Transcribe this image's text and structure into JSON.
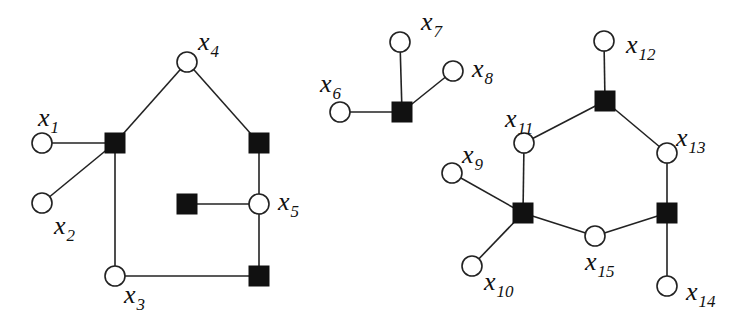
{
  "diagram": {
    "type": "factor-graph",
    "variables": [
      {
        "id": "x1",
        "name": "x",
        "sub": "1",
        "cx": 42,
        "cy": 143,
        "lx": 38,
        "ly": 126
      },
      {
        "id": "x2",
        "name": "x",
        "sub": "2",
        "cx": 42,
        "cy": 203,
        "lx": 54,
        "ly": 234
      },
      {
        "id": "x3",
        "name": "x",
        "sub": "3",
        "cx": 115,
        "cy": 276,
        "lx": 124,
        "ly": 303
      },
      {
        "id": "x4",
        "name": "x",
        "sub": "4",
        "cx": 187,
        "cy": 62,
        "lx": 198,
        "ly": 50
      },
      {
        "id": "x5",
        "name": "x",
        "sub": "5",
        "cx": 259,
        "cy": 204,
        "lx": 278,
        "ly": 210
      },
      {
        "id": "x6",
        "name": "x",
        "sub": "6",
        "cx": 340,
        "cy": 112,
        "lx": 320,
        "ly": 92
      },
      {
        "id": "x7",
        "name": "x",
        "sub": "7",
        "cx": 400,
        "cy": 42,
        "lx": 421,
        "ly": 30
      },
      {
        "id": "x8",
        "name": "x",
        "sub": "8",
        "cx": 453,
        "cy": 71,
        "lx": 472,
        "ly": 77
      },
      {
        "id": "x9",
        "name": "x",
        "sub": "9",
        "cx": 452,
        "cy": 173,
        "lx": 462,
        "ly": 163
      },
      {
        "id": "x10",
        "name": "x",
        "sub": "10",
        "cx": 472,
        "cy": 266,
        "lx": 484,
        "ly": 290
      },
      {
        "id": "x11",
        "name": "x",
        "sub": "11",
        "cx": 524,
        "cy": 143,
        "lx": 505,
        "ly": 127
      },
      {
        "id": "x12",
        "name": "x",
        "sub": "12",
        "cx": 604,
        "cy": 41,
        "lx": 626,
        "ly": 53
      },
      {
        "id": "x13",
        "name": "x",
        "sub": "13",
        "cx": 667,
        "cy": 153,
        "lx": 676,
        "ly": 146
      },
      {
        "id": "x14",
        "name": "x",
        "sub": "14",
        "cx": 667,
        "cy": 286,
        "lx": 686,
        "ly": 300
      },
      {
        "id": "x15",
        "name": "x",
        "sub": "15",
        "cx": 595,
        "cy": 236,
        "lx": 585,
        "ly": 270
      }
    ],
    "factors": [
      {
        "id": "fA",
        "cx": 115,
        "cy": 143
      },
      {
        "id": "fB",
        "cx": 259,
        "cy": 143
      },
      {
        "id": "fC",
        "cx": 187,
        "cy": 204
      },
      {
        "id": "fD",
        "cx": 259,
        "cy": 276
      },
      {
        "id": "fE",
        "cx": 402,
        "cy": 112
      },
      {
        "id": "fF",
        "cx": 605,
        "cy": 101
      },
      {
        "id": "fG",
        "cx": 523,
        "cy": 213
      },
      {
        "id": "fH",
        "cx": 667,
        "cy": 213
      }
    ],
    "edges": [
      [
        "x1",
        "fA"
      ],
      [
        "x2",
        "fA"
      ],
      [
        "x4",
        "fA"
      ],
      [
        "x3",
        "fA"
      ],
      [
        "x4",
        "fB"
      ],
      [
        "fB",
        "x5"
      ],
      [
        "fC",
        "x5"
      ],
      [
        "x5",
        "fD"
      ],
      [
        "x3",
        "fD"
      ],
      [
        "x6",
        "fE"
      ],
      [
        "x7",
        "fE"
      ],
      [
        "x8",
        "fE"
      ],
      [
        "x12",
        "fF"
      ],
      [
        "x11",
        "fF"
      ],
      [
        "x13",
        "fF"
      ],
      [
        "x11",
        "fG"
      ],
      [
        "x9",
        "fG"
      ],
      [
        "x10",
        "fG"
      ],
      [
        "x15",
        "fG"
      ],
      [
        "x13",
        "fH"
      ],
      [
        "x15",
        "fH"
      ],
      [
        "x14",
        "fH"
      ]
    ],
    "style": {
      "variable_radius": 10,
      "factor_size": 20,
      "stroke_color": "#222222",
      "factor_fill": "#111111",
      "variable_fill": "#ffffff"
    }
  }
}
